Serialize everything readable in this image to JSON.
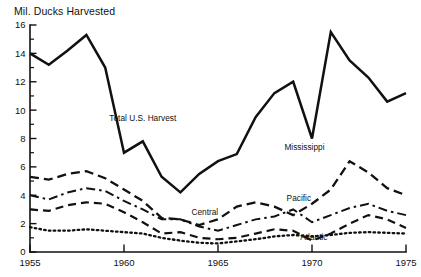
{
  "chart_data": {
    "type": "line",
    "title": "Mil. Ducks Harvested",
    "xlabel": "",
    "ylabel": "Mil. Ducks Harvested",
    "xlim": [
      1955,
      1975
    ],
    "ylim": [
      0,
      16
    ],
    "ytick_labels": [
      "0",
      "2",
      "4",
      "6",
      "8",
      "10",
      "12",
      "14",
      "16"
    ],
    "yticks": [
      0,
      2,
      4,
      6,
      8,
      10,
      12,
      14,
      16
    ],
    "yticks_minor": [
      1,
      3,
      5,
      7,
      9,
      11,
      13,
      15
    ],
    "xtick_labels": [
      "1955",
      "1960",
      "1965",
      "1970",
      "1975"
    ],
    "xticks": [
      1955,
      1960,
      1965,
      1970,
      1975
    ],
    "grid": false,
    "legend": "inline-annotations",
    "x": [
      1955,
      1956,
      1957,
      1958,
      1959,
      1960,
      1961,
      1962,
      1963,
      1964,
      1965,
      1966,
      1967,
      1968,
      1969,
      1970,
      1971,
      1972,
      1973,
      1974,
      1975
    ],
    "series": [
      {
        "name": "Total U.S. Harvest",
        "style": "solid",
        "label_x": 1961.0,
        "label_y": 9.2,
        "values": [
          14.0,
          13.2,
          14.2,
          15.3,
          13.0,
          7.0,
          7.8,
          5.3,
          4.2,
          5.5,
          6.4,
          6.9,
          9.5,
          11.2,
          12.0,
          8.0,
          15.5,
          13.5,
          12.3,
          10.6,
          11.2
        ]
      },
      {
        "name": "Mississippi",
        "style": "long-dash",
        "label_x": 1969.6,
        "label_y": 7.2,
        "values": [
          5.3,
          5.1,
          5.5,
          5.7,
          5.2,
          4.4,
          3.6,
          2.4,
          2.3,
          1.9,
          2.3,
          3.2,
          3.5,
          3.2,
          2.6,
          3.4,
          4.4,
          6.4,
          5.6,
          4.5,
          4.0
        ]
      },
      {
        "name": "Pacific",
        "style": "dash-dot",
        "label_x": 1969.3,
        "label_y": 3.6,
        "values": [
          4.0,
          3.7,
          4.2,
          4.5,
          4.3,
          3.6,
          3.0,
          2.3,
          2.3,
          1.8,
          1.5,
          1.9,
          2.3,
          2.5,
          3.0,
          2.1,
          2.6,
          3.1,
          3.4,
          2.9,
          2.6
        ]
      },
      {
        "name": "Central",
        "style": "dash",
        "label_x": 1964.3,
        "label_y": 2.6,
        "values": [
          3.0,
          2.9,
          3.3,
          3.5,
          3.4,
          2.8,
          2.1,
          1.3,
          1.4,
          1.0,
          0.9,
          1.0,
          1.3,
          1.6,
          1.5,
          0.8,
          1.3,
          2.0,
          2.6,
          2.3,
          1.7
        ]
      },
      {
        "name": "Atlantic",
        "style": "dotted",
        "label_x": 1970.1,
        "label_y": 0.85,
        "values": [
          1.75,
          1.5,
          1.5,
          1.6,
          1.5,
          1.4,
          1.3,
          1.0,
          0.8,
          0.65,
          0.6,
          0.75,
          0.9,
          1.1,
          1.2,
          1.1,
          1.2,
          1.35,
          1.4,
          1.35,
          1.3
        ]
      }
    ],
    "series_final_values": {
      "Mississippi": 6.0,
      "Pacific": 4.3,
      "Central": 2.6,
      "Atlantic": 1.45
    }
  }
}
